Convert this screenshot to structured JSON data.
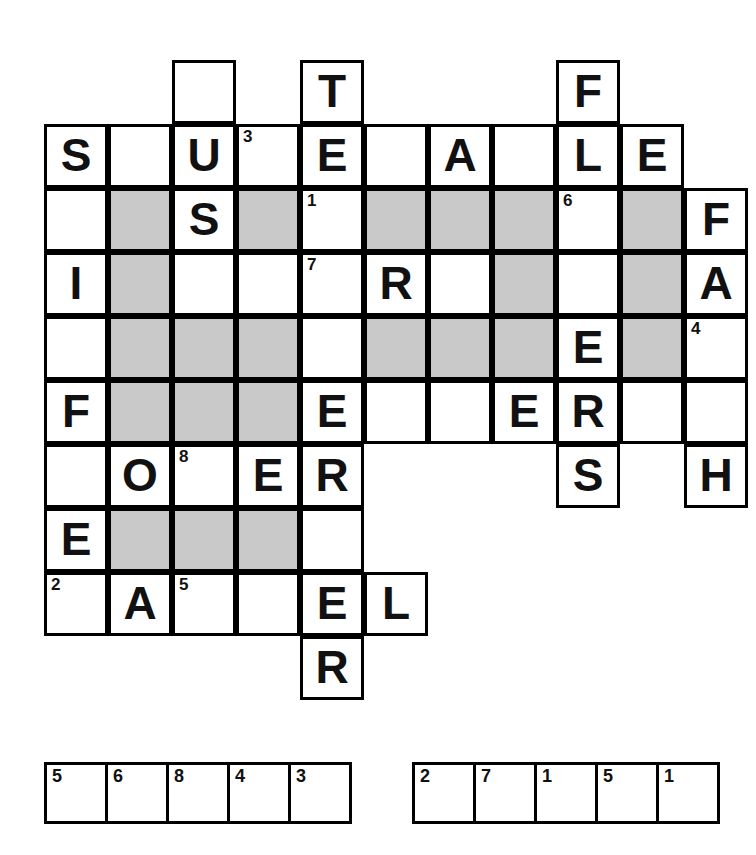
{
  "puzzle": {
    "title": "Crossword Puzzle Grid",
    "type": "crossword",
    "columns": 11,
    "rows": 10,
    "cell_size": 64,
    "origin_x": 44,
    "origin_y": 60,
    "colors": {
      "grid_line": "#000000",
      "cell_background": "#ffffff",
      "shaded_cell": "#c9c9c9",
      "letter": "#111111"
    },
    "cells": [
      {
        "row": 0,
        "col": 2,
        "letter": "",
        "num": "",
        "shaded": false
      },
      {
        "row": 0,
        "col": 4,
        "letter": "T",
        "num": "",
        "shaded": false
      },
      {
        "row": 0,
        "col": 8,
        "letter": "F",
        "num": "",
        "shaded": false
      },
      {
        "row": 1,
        "col": 0,
        "letter": "S",
        "num": "",
        "shaded": false
      },
      {
        "row": 1,
        "col": 1,
        "letter": "",
        "num": "",
        "shaded": false
      },
      {
        "row": 1,
        "col": 2,
        "letter": "U",
        "num": "",
        "shaded": false
      },
      {
        "row": 1,
        "col": 3,
        "letter": "",
        "num": "3",
        "shaded": false
      },
      {
        "row": 1,
        "col": 4,
        "letter": "E",
        "num": "",
        "shaded": false
      },
      {
        "row": 1,
        "col": 5,
        "letter": "",
        "num": "",
        "shaded": false
      },
      {
        "row": 1,
        "col": 6,
        "letter": "A",
        "num": "",
        "shaded": false
      },
      {
        "row": 1,
        "col": 7,
        "letter": "",
        "num": "",
        "shaded": false
      },
      {
        "row": 1,
        "col": 8,
        "letter": "L",
        "num": "",
        "shaded": false
      },
      {
        "row": 1,
        "col": 9,
        "letter": "E",
        "num": "",
        "shaded": false
      },
      {
        "row": 2,
        "col": 0,
        "letter": "",
        "num": "",
        "shaded": false
      },
      {
        "row": 2,
        "col": 1,
        "letter": "",
        "num": "",
        "shaded": true
      },
      {
        "row": 2,
        "col": 2,
        "letter": "S",
        "num": "",
        "shaded": false
      },
      {
        "row": 2,
        "col": 3,
        "letter": "",
        "num": "",
        "shaded": true
      },
      {
        "row": 2,
        "col": 4,
        "letter": "",
        "num": "1",
        "shaded": false
      },
      {
        "row": 2,
        "col": 5,
        "letter": "",
        "num": "",
        "shaded": true
      },
      {
        "row": 2,
        "col": 6,
        "letter": "",
        "num": "",
        "shaded": true
      },
      {
        "row": 2,
        "col": 7,
        "letter": "",
        "num": "",
        "shaded": true
      },
      {
        "row": 2,
        "col": 8,
        "letter": "",
        "num": "6",
        "shaded": false
      },
      {
        "row": 2,
        "col": 9,
        "letter": "",
        "num": "",
        "shaded": true
      },
      {
        "row": 2,
        "col": 10,
        "letter": "F",
        "num": "",
        "shaded": false
      },
      {
        "row": 3,
        "col": 0,
        "letter": "I",
        "num": "",
        "shaded": false
      },
      {
        "row": 3,
        "col": 1,
        "letter": "",
        "num": "",
        "shaded": true
      },
      {
        "row": 3,
        "col": 2,
        "letter": "",
        "num": "",
        "shaded": false
      },
      {
        "row": 3,
        "col": 3,
        "letter": "",
        "num": "",
        "shaded": false
      },
      {
        "row": 3,
        "col": 4,
        "letter": "",
        "num": "7",
        "shaded": false
      },
      {
        "row": 3,
        "col": 5,
        "letter": "R",
        "num": "",
        "shaded": false
      },
      {
        "row": 3,
        "col": 6,
        "letter": "",
        "num": "",
        "shaded": false
      },
      {
        "row": 3,
        "col": 7,
        "letter": "",
        "num": "",
        "shaded": true
      },
      {
        "row": 3,
        "col": 8,
        "letter": "",
        "num": "",
        "shaded": false
      },
      {
        "row": 3,
        "col": 9,
        "letter": "",
        "num": "",
        "shaded": true
      },
      {
        "row": 3,
        "col": 10,
        "letter": "A",
        "num": "",
        "shaded": false
      },
      {
        "row": 4,
        "col": 0,
        "letter": "",
        "num": "",
        "shaded": false
      },
      {
        "row": 4,
        "col": 1,
        "letter": "",
        "num": "",
        "shaded": true
      },
      {
        "row": 4,
        "col": 2,
        "letter": "",
        "num": "",
        "shaded": true
      },
      {
        "row": 4,
        "col": 3,
        "letter": "",
        "num": "",
        "shaded": true
      },
      {
        "row": 4,
        "col": 4,
        "letter": "",
        "num": "",
        "shaded": false
      },
      {
        "row": 4,
        "col": 5,
        "letter": "",
        "num": "",
        "shaded": true
      },
      {
        "row": 4,
        "col": 6,
        "letter": "",
        "num": "",
        "shaded": true
      },
      {
        "row": 4,
        "col": 7,
        "letter": "",
        "num": "",
        "shaded": true
      },
      {
        "row": 4,
        "col": 8,
        "letter": "E",
        "num": "",
        "shaded": false
      },
      {
        "row": 4,
        "col": 9,
        "letter": "",
        "num": "",
        "shaded": true
      },
      {
        "row": 4,
        "col": 10,
        "letter": "",
        "num": "4",
        "shaded": false
      },
      {
        "row": 5,
        "col": 0,
        "letter": "F",
        "num": "",
        "shaded": false
      },
      {
        "row": 5,
        "col": 1,
        "letter": "",
        "num": "",
        "shaded": true
      },
      {
        "row": 5,
        "col": 2,
        "letter": "",
        "num": "",
        "shaded": true
      },
      {
        "row": 5,
        "col": 3,
        "letter": "",
        "num": "",
        "shaded": true
      },
      {
        "row": 5,
        "col": 4,
        "letter": "E",
        "num": "",
        "shaded": false
      },
      {
        "row": 5,
        "col": 5,
        "letter": "",
        "num": "",
        "shaded": false
      },
      {
        "row": 5,
        "col": 6,
        "letter": "",
        "num": "",
        "shaded": false
      },
      {
        "row": 5,
        "col": 7,
        "letter": "E",
        "num": "",
        "shaded": false
      },
      {
        "row": 5,
        "col": 8,
        "letter": "R",
        "num": "",
        "shaded": false
      },
      {
        "row": 5,
        "col": 9,
        "letter": "",
        "num": "",
        "shaded": false
      },
      {
        "row": 5,
        "col": 10,
        "letter": "",
        "num": "",
        "shaded": false
      },
      {
        "row": 6,
        "col": 0,
        "letter": "",
        "num": "",
        "shaded": false
      },
      {
        "row": 6,
        "col": 1,
        "letter": "O",
        "num": "",
        "shaded": false
      },
      {
        "row": 6,
        "col": 2,
        "letter": "",
        "num": "8",
        "shaded": false
      },
      {
        "row": 6,
        "col": 3,
        "letter": "E",
        "num": "",
        "shaded": false
      },
      {
        "row": 6,
        "col": 4,
        "letter": "R",
        "num": "",
        "shaded": false
      },
      {
        "row": 6,
        "col": 8,
        "letter": "S",
        "num": "",
        "shaded": false
      },
      {
        "row": 6,
        "col": 10,
        "letter": "H",
        "num": "",
        "shaded": false
      },
      {
        "row": 7,
        "col": 0,
        "letter": "E",
        "num": "",
        "shaded": false
      },
      {
        "row": 7,
        "col": 1,
        "letter": "",
        "num": "",
        "shaded": true
      },
      {
        "row": 7,
        "col": 2,
        "letter": "",
        "num": "",
        "shaded": true
      },
      {
        "row": 7,
        "col": 3,
        "letter": "",
        "num": "",
        "shaded": true
      },
      {
        "row": 7,
        "col": 4,
        "letter": "",
        "num": "",
        "shaded": false
      },
      {
        "row": 8,
        "col": 0,
        "letter": "",
        "num": "2",
        "shaded": false
      },
      {
        "row": 8,
        "col": 1,
        "letter": "A",
        "num": "",
        "shaded": false
      },
      {
        "row": 8,
        "col": 2,
        "letter": "",
        "num": "5",
        "shaded": false
      },
      {
        "row": 8,
        "col": 3,
        "letter": "",
        "num": "",
        "shaded": false
      },
      {
        "row": 8,
        "col": 4,
        "letter": "E",
        "num": "",
        "shaded": false
      },
      {
        "row": 8,
        "col": 5,
        "letter": "L",
        "num": "",
        "shaded": false
      },
      {
        "row": 9,
        "col": 4,
        "letter": "R",
        "num": "",
        "shaded": false
      }
    ]
  },
  "answer_strips": [
    {
      "name": "answer-strip-left",
      "cells": [
        {
          "num": "5",
          "letter": ""
        },
        {
          "num": "6",
          "letter": ""
        },
        {
          "num": "8",
          "letter": ""
        },
        {
          "num": "4",
          "letter": ""
        },
        {
          "num": "3",
          "letter": ""
        }
      ]
    },
    {
      "name": "answer-strip-right",
      "cells": [
        {
          "num": "2",
          "letter": ""
        },
        {
          "num": "7",
          "letter": ""
        },
        {
          "num": "1",
          "letter": ""
        },
        {
          "num": "5",
          "letter": ""
        },
        {
          "num": "1",
          "letter": ""
        }
      ]
    }
  ]
}
